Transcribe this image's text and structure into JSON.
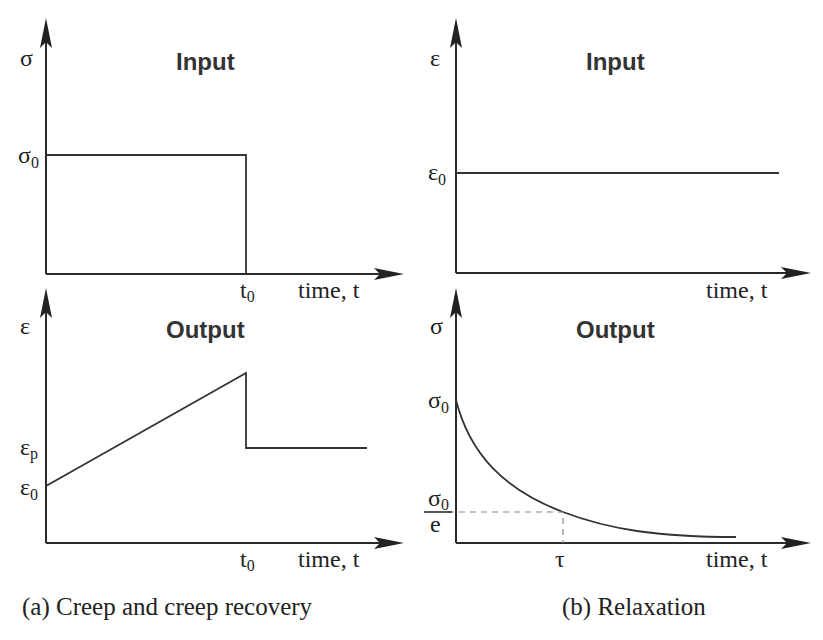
{
  "panels": {
    "creep_input": {
      "title": "Input",
      "y_label": "σ",
      "y_level_label": "σ",
      "y_level_sub": "0",
      "x_mark_label": "t",
      "x_mark_sub": "0",
      "x_label": "time, t"
    },
    "creep_output": {
      "title": "Output",
      "y_label": "ε",
      "level_p_label": "ε",
      "level_p_sub": "p",
      "level_0_label": "ε",
      "level_0_sub": "0",
      "x_mark_label": "t",
      "x_mark_sub": "0",
      "x_label": "time, t"
    },
    "relax_input": {
      "title": "Input",
      "y_label": "ε",
      "y_level_label": "ε",
      "y_level_sub": "0",
      "x_label": "time, t"
    },
    "relax_output": {
      "title": "Output",
      "y_label": "σ",
      "y_level_label": "σ",
      "y_level_sub": "0",
      "frac_num": "σ",
      "frac_num_sub": "0",
      "frac_den": "e",
      "x_mark_label": "τ",
      "x_label": "time, t"
    }
  },
  "captions": {
    "a": "(a) Creep and creep recovery",
    "b": "(b) Relaxation"
  }
}
